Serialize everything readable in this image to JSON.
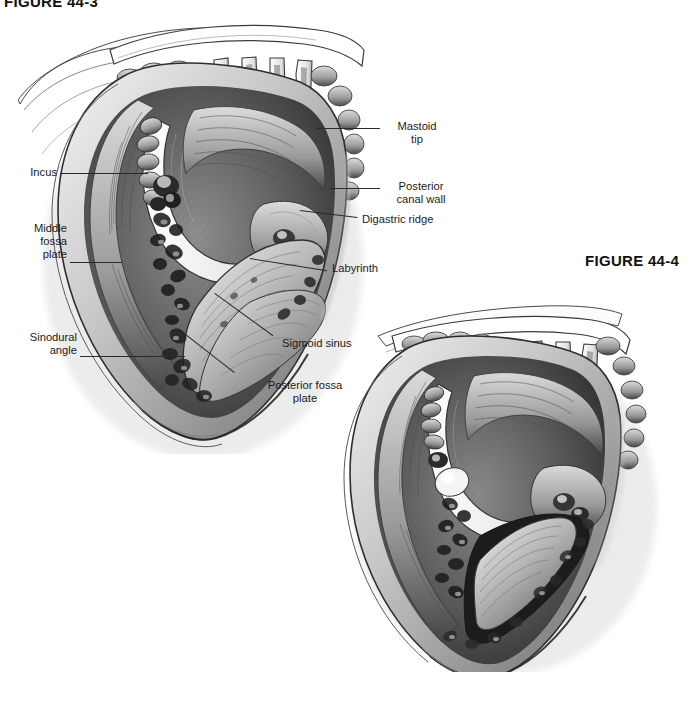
{
  "document": {
    "type": "medical-textbook-figure-page",
    "background_color": "#ffffff",
    "ink_color": "#1b1b1b"
  },
  "captions": {
    "top_left": "FIGURE 44-3",
    "right": "FIGURE 44-4"
  },
  "figures": [
    {
      "id": "figure-44-3",
      "position": "upper-left",
      "description": "Grayscale pencil illustration of a canal-wall-up mastoidectomy surgical view with self-retaining retractor prongs, showing the mastoid cavity and adjacent structures",
      "labeled": true
    },
    {
      "id": "figure-44-4",
      "position": "lower-right",
      "description": "Grayscale pencil illustration of a further-dissected mastoidectomy surgical view, unlabeled",
      "labeled": false
    }
  ],
  "annotations": [
    {
      "key": "incus",
      "text": "Incus",
      "side": "left",
      "align": "right",
      "lines": 1
    },
    {
      "key": "middle_fossa_plate",
      "text": "Middle\nfossa\nplate",
      "side": "left",
      "align": "right",
      "lines": 3
    },
    {
      "key": "sinodural_angle",
      "text": "Sinodural\nangle",
      "side": "left",
      "align": "right",
      "lines": 2
    },
    {
      "key": "mastoid_tip",
      "text": "Mastoid\ntip",
      "side": "right",
      "align": "center",
      "lines": 2
    },
    {
      "key": "posterior_canal_wall",
      "text": "Posterior\ncanal wall",
      "side": "right",
      "align": "center",
      "lines": 2
    },
    {
      "key": "digastric_ridge",
      "text": "Digastric ridge",
      "side": "right",
      "align": "left",
      "lines": 1
    },
    {
      "key": "labyrinth",
      "text": "Labyrinth",
      "side": "right",
      "align": "left",
      "lines": 1
    },
    {
      "key": "sigmoid_sinus",
      "text": "Sigmoid sinus",
      "side": "right",
      "align": "left",
      "lines": 1
    },
    {
      "key": "posterior_fossa_plate",
      "text": "Posterior fossa\nplate",
      "side": "right",
      "align": "center",
      "lines": 2
    }
  ]
}
